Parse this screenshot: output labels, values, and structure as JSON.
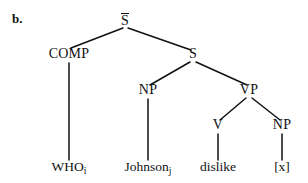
{
  "figure": {
    "item_label": "b.",
    "type": "syntax-tree",
    "ink_color": "#111111",
    "background_color": "#ffffff"
  },
  "nodes": {
    "root": {
      "label": "S",
      "overbar": true,
      "x": 125,
      "y": 24
    },
    "comp": {
      "label": "COMP",
      "overbar": false,
      "x": 69,
      "y": 58
    },
    "s_embedded": {
      "label": "S",
      "overbar": false,
      "x": 193,
      "y": 58
    },
    "np_subject": {
      "label": "NP",
      "overbar": false,
      "x": 148,
      "y": 94
    },
    "vp": {
      "label": "VP",
      "overbar": false,
      "x": 249,
      "y": 94
    },
    "v": {
      "label": "V",
      "overbar": false,
      "x": 218,
      "y": 129
    },
    "np_object": {
      "label": "NP",
      "overbar": false,
      "x": 282,
      "y": 129
    }
  },
  "terminals": {
    "who": {
      "text": "WHO",
      "subscript": "i",
      "x": 69,
      "y": 171
    },
    "johnson": {
      "text": "Johnson",
      "subscript": "j",
      "x": 148,
      "y": 171
    },
    "dislike": {
      "text": "dislike",
      "subscript": "",
      "x": 218,
      "y": 171
    },
    "trace": {
      "text": "[x]",
      "subscript": "",
      "x": 282,
      "y": 171
    }
  },
  "edges": [
    {
      "name": "sbar-to-comp",
      "x1": 123,
      "y1": 28,
      "x2": 71,
      "y2": 48
    },
    {
      "name": "sbar-to-s",
      "x1": 128,
      "y1": 28,
      "x2": 191,
      "y2": 50
    },
    {
      "name": "s-to-np",
      "x1": 190,
      "y1": 62,
      "x2": 150,
      "y2": 85
    },
    {
      "name": "s-to-vp",
      "x1": 196,
      "y1": 62,
      "x2": 247,
      "y2": 85
    },
    {
      "name": "vp-to-v",
      "x1": 246,
      "y1": 98,
      "x2": 220,
      "y2": 120
    },
    {
      "name": "vp-to-npobj",
      "x1": 252,
      "y1": 98,
      "x2": 280,
      "y2": 120
    },
    {
      "name": "comp-to-who",
      "x1": 69,
      "y1": 63,
      "x2": 69,
      "y2": 160
    },
    {
      "name": "np-to-johnson",
      "x1": 148,
      "y1": 99,
      "x2": 148,
      "y2": 160
    },
    {
      "name": "v-to-dislike",
      "x1": 218,
      "y1": 134,
      "x2": 218,
      "y2": 160
    },
    {
      "name": "npobj-to-trace",
      "x1": 282,
      "y1": 134,
      "x2": 282,
      "y2": 160
    }
  ]
}
